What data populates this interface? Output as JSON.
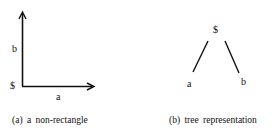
{
  "panel_a": {
    "origin_label": "$",
    "y_axis_label": "b",
    "x_axis_label": "a",
    "caption": "(a) a  non-rectangle"
  },
  "panel_b": {
    "root_label": "$",
    "left_child_label": "a",
    "right_child_label": "b",
    "caption": "(b) tree  representation"
  },
  "colors": {
    "ink": "#111111",
    "background": "#ffffff"
  }
}
